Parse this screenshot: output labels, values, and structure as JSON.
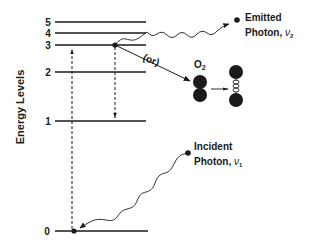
{
  "diagram": {
    "axis_title": "Energy Levels",
    "levels": [
      {
        "label": "0",
        "y": 231
      },
      {
        "label": "1",
        "y": 121
      },
      {
        "label": "2",
        "y": 72
      },
      {
        "label": "3",
        "y": 45
      },
      {
        "label": "4",
        "y": 33
      },
      {
        "label": "5",
        "y": 22
      }
    ],
    "emitted": {
      "line1": "Emitted",
      "line2": "Photon, ",
      "symbol": "ν",
      "subscript": "2"
    },
    "incident": {
      "line1": "Incident",
      "line2": "Photon, ",
      "symbol": "ν",
      "subscript": "1"
    },
    "or_label": "(or)",
    "o2_label": "O",
    "o2_subscript": "2",
    "colors": {
      "ink": "#1a1a1a",
      "background": "#ffffff"
    }
  }
}
